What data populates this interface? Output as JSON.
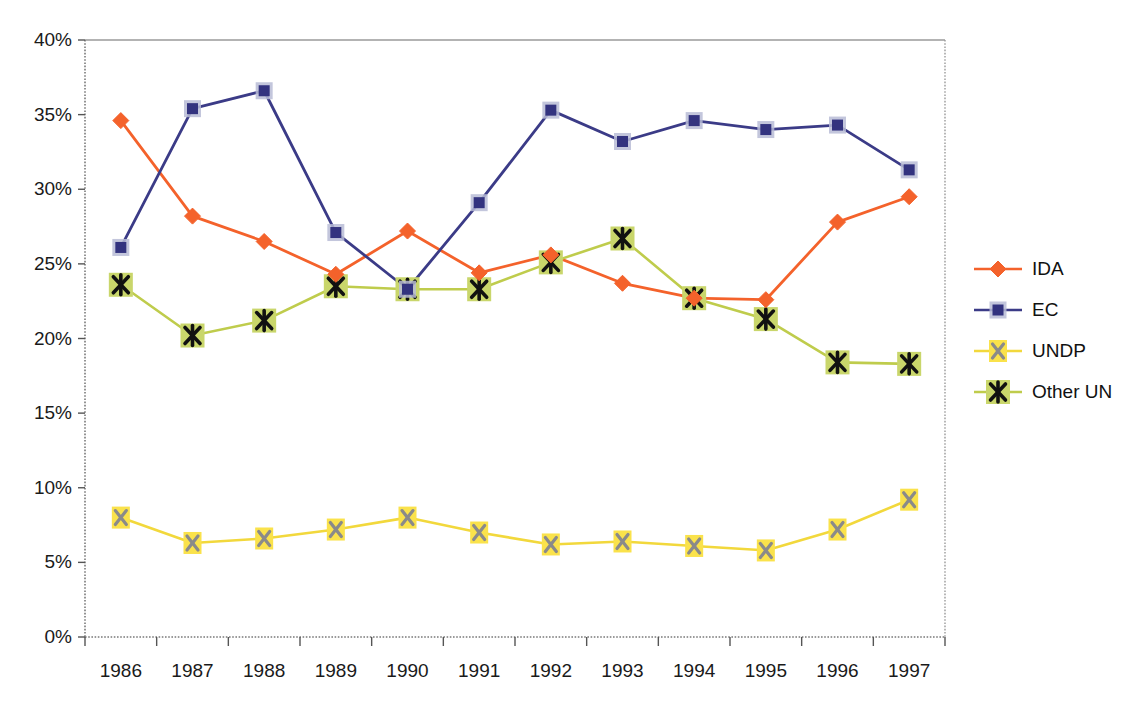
{
  "chart_data": {
    "type": "line",
    "title": "",
    "subtitle": "",
    "xlabel": "",
    "ylabel": "",
    "categories": [
      "1986",
      "1987",
      "1988",
      "1989",
      "1990",
      "1991",
      "1992",
      "1993",
      "1994",
      "1995",
      "1996",
      "1997"
    ],
    "x_tick_labels": [
      "1986",
      "1987",
      "1988",
      "1989",
      "1990",
      "1991",
      "1992",
      "1993",
      "1994",
      "1995",
      "1996",
      "1997"
    ],
    "y_tick_labels": [
      "0%",
      "5%",
      "10%",
      "15%",
      "20%",
      "25%",
      "30%",
      "35%",
      "40%"
    ],
    "y_tick_values": [
      0,
      5,
      10,
      15,
      20,
      25,
      30,
      35,
      40
    ],
    "ylim": [
      0,
      40
    ],
    "y_unit": "%",
    "grid": false,
    "legend_position": "right",
    "series": [
      {
        "name": "IDA",
        "color": "#F4622B",
        "marker": "diamond",
        "marker_color": "#F4622B",
        "values": [
          34.6,
          28.2,
          26.5,
          24.3,
          27.2,
          24.4,
          25.6,
          23.7,
          22.7,
          22.6,
          27.8,
          29.5
        ]
      },
      {
        "name": "EC",
        "color": "#3B3B87",
        "marker": "square",
        "marker_color": "#33337F",
        "values": [
          26.1,
          35.4,
          36.6,
          27.1,
          23.3,
          29.1,
          35.3,
          33.2,
          34.6,
          34.0,
          34.3,
          31.3
        ]
      },
      {
        "name": "UNDP",
        "color": "#F2D83C",
        "marker": "x",
        "marker_color": "#8A8A8A",
        "marker_bg": "#FAE24B",
        "values": [
          8.0,
          6.3,
          6.6,
          7.2,
          8.0,
          7.0,
          6.2,
          6.4,
          6.1,
          5.8,
          7.2,
          9.2
        ]
      },
      {
        "name": "Other UN",
        "color": "#BFCC4C",
        "marker": "asterisk",
        "marker_color": "#111111",
        "marker_bg": "#C9D66B",
        "values": [
          23.6,
          20.2,
          21.2,
          23.5,
          23.3,
          23.3,
          25.1,
          26.7,
          22.7,
          21.3,
          18.4,
          18.3
        ]
      }
    ]
  },
  "legend": {
    "items": [
      {
        "label": "IDA"
      },
      {
        "label": "EC"
      },
      {
        "label": "UNDP"
      },
      {
        "label": "Other UN"
      }
    ]
  },
  "colors": {
    "ida": "#F4622B",
    "ec": "#3B3B87",
    "undp": "#F2D83C",
    "other_un": "#BFCC4C",
    "axis": "#7a7a7a",
    "text": "#111111"
  }
}
